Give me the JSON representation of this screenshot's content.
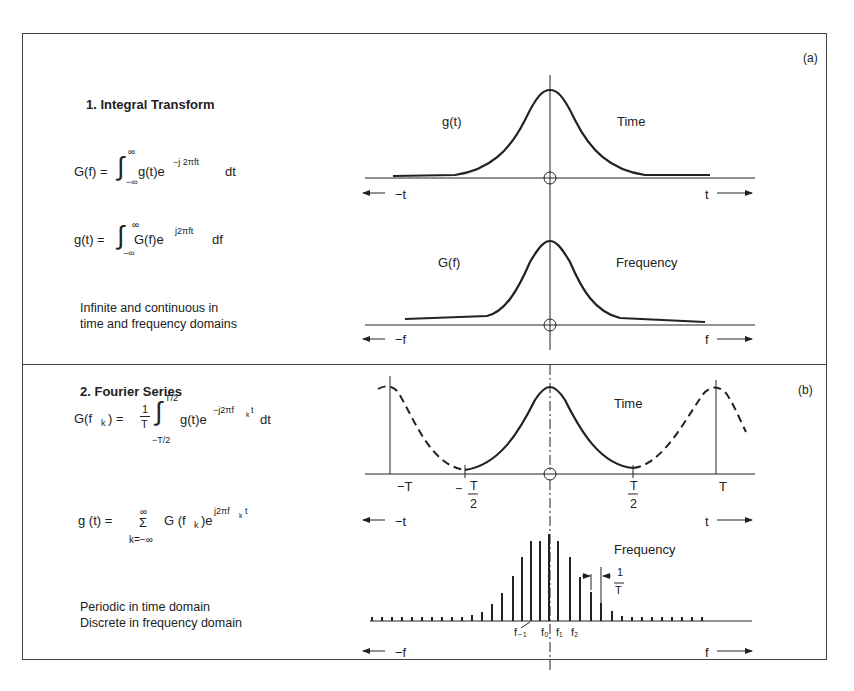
{
  "panel_a": {
    "tag": "(a)",
    "heading": "1. Integral Transform",
    "eq1": {
      "lhs": "G(f) =",
      "integrand": "g(t)e",
      "exp": "−j 2πft",
      "tail": "dt",
      "upper": "∞",
      "lower": "−∞"
    },
    "eq2": {
      "lhs": "g(t) =",
      "integrand": "G(f)e",
      "exp": "j2πft",
      "tail": "df",
      "upper": "∞",
      "lower": "−∞"
    },
    "description": [
      "Infinite and continuous in",
      "time and frequency domains"
    ],
    "time_plot": {
      "curve_label": "g(t)",
      "domain_label": "Time",
      "left_axis": "−t",
      "right_axis": "t"
    },
    "freq_plot": {
      "curve_label": "G(f)",
      "domain_label": "Frequency",
      "left_axis": "−f",
      "right_axis": "f"
    }
  },
  "panel_b": {
    "tag": "(b)",
    "heading": "2. Fourier Series",
    "eq1": {
      "lhs": "G(f",
      "lhs_sub": "k",
      "lhs_end": ") =",
      "frac_num": "1",
      "frac_den": "T",
      "upper": "T/2",
      "lower": "−T/2",
      "integrand": "g(t)e",
      "exp": "−j2πf",
      "exp_sub": "k",
      "exp_end": "t",
      "tail": "dt"
    },
    "eq2": {
      "lhs": "g (t) =",
      "sum": "Σ",
      "upper": "∞",
      "lower": "k=−∞",
      "term": "G (f",
      "term_sub": "k",
      "term_end": ")e",
      "exp": "j2πf",
      "exp_sub": "k",
      "exp_end": "t"
    },
    "description": [
      "Periodic in time domain",
      "Discrete in frequency domain"
    ],
    "time_plot": {
      "domain_label": "Time",
      "ticks": [
        "−T",
        "−T/2",
        "T/2",
        "T"
      ],
      "left_axis": "−t",
      "right_axis": "t"
    },
    "freq_plot": {
      "domain_label": "Frequency",
      "spacing_label_num": "1",
      "spacing_label_den": "T",
      "harmonics": [
        "f₋₁",
        "f₀",
        "f₁",
        "f₂"
      ],
      "left_axis": "−f",
      "right_axis": "f"
    }
  },
  "colors": {
    "ink": "#222222",
    "background": "#ffffff"
  }
}
